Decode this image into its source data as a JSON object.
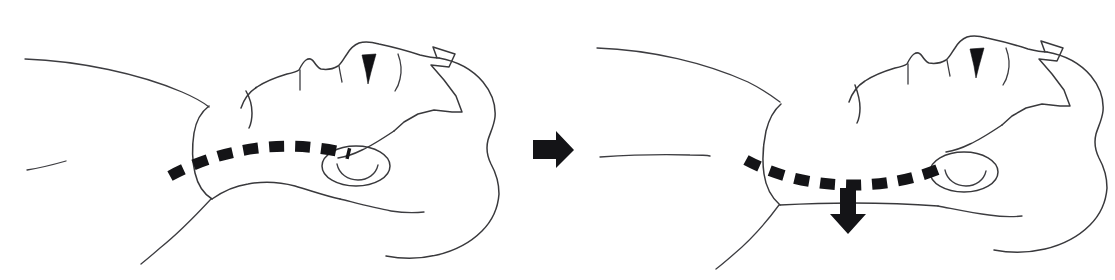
{
  "figure": {
    "background_color": "#ffffff",
    "line_color": "#39393c",
    "accent_color": "#141417",
    "width": 1115,
    "height": 280,
    "panels": [
      {
        "id": "panel-before",
        "label": "Before: neutral head position with airway line level",
        "figure_label": "supine head and neck, lateral view",
        "airway_line_label": "airway contour dashed line, arched",
        "arrow": null
      },
      {
        "id": "panel-after",
        "label": "After: head tilted back, airway line displaced downward",
        "figure_label": "supine head and neck tilted back, lateral view",
        "airway_line_label": "airway contour dashed line, sagging",
        "arrow": {
          "name": "downward-displacement-arrow",
          "direction": "down",
          "color": "#141417"
        }
      }
    ],
    "transition_arrow": {
      "name": "rightward-transition-arrow",
      "direction": "right",
      "color": "#141417"
    },
    "parts": {
      "chin": "chin",
      "lips": "lips",
      "nose": "nose",
      "eye": "closed-eye",
      "brow": "brow-line",
      "hairline": "zigzag-hairline",
      "ear": "ear",
      "neck": "neck",
      "shoulder": "shoulder",
      "chest": "chest-line",
      "skull": "back-of-head"
    }
  }
}
